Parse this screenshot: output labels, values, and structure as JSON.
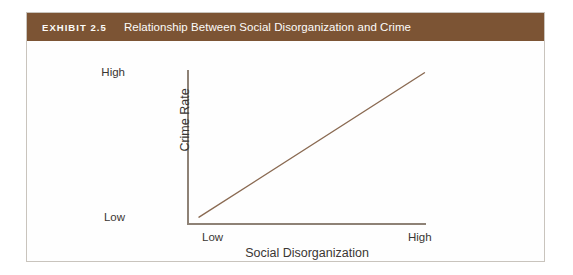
{
  "exhibit": {
    "number_label": "EXHIBIT 2.5",
    "title": "Relationship Between Social Disorganization and Crime",
    "header_color": "#7c5434",
    "frame_border_color": "#c9c4bd"
  },
  "chart_data": {
    "type": "line",
    "title": "Relationship Between Social Disorganization and Crime",
    "xlabel": "Social Disorganization",
    "ylabel": "Crime Rate",
    "x_tick_labels": [
      "Low",
      "High"
    ],
    "y_tick_labels": [
      "Low",
      "High"
    ],
    "xlim": [
      0,
      1
    ],
    "ylim": [
      0,
      1
    ],
    "grid": false,
    "legend": null,
    "series": [
      {
        "name": "Crime Rate vs. Social Disorganization",
        "x": [
          0.05,
          1.0
        ],
        "y": [
          0.03,
          0.98
        ],
        "color": "#8a6a52",
        "width": 1.4,
        "description": "Straight positive linear trend rising from low-low to high-high"
      }
    ],
    "annotations": []
  }
}
